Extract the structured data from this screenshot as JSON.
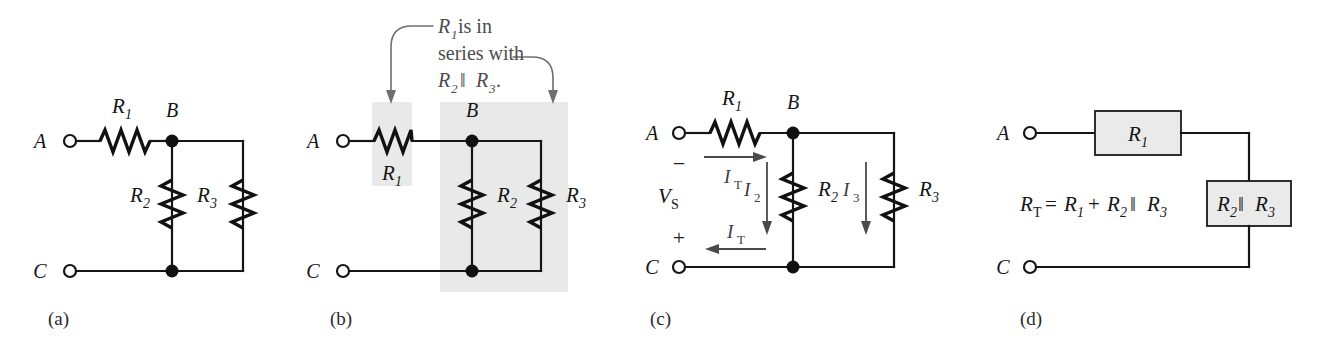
{
  "figure": {
    "background_color": "#ffffff",
    "wire_color": "#151515",
    "shade_color": "#e9e9e9",
    "block_fill": "#eaeaea",
    "leader_color": "#6f6f6f",
    "current_arrow_color": "#4a4a4a"
  },
  "panels": [
    {
      "id": "a",
      "label": "(a)",
      "caption": "",
      "terminals": [
        "A",
        "C"
      ],
      "node_labels": [
        "B"
      ],
      "resistors": [
        {
          "name": "R",
          "sub": "1",
          "orientation": "horizontal"
        },
        {
          "name": "R",
          "sub": "2",
          "orientation": "vertical"
        },
        {
          "name": "R",
          "sub": "3",
          "orientation": "vertical"
        }
      ]
    },
    {
      "id": "b",
      "label": "(b)",
      "annotation": {
        "line1_italic": "R",
        "line1_sub": "1",
        "line1_rest": " is in",
        "line2": "series with",
        "line3_italic_a": "R",
        "line3_sub_a": "2",
        "line3_bar": " ‖ ",
        "line3_italic_b": "R",
        "line3_sub_b": "3",
        "line3_period": ".",
        "full_text": "R1 is in series with R2 ‖ R3."
      },
      "terminals": [
        "A",
        "C"
      ],
      "node_labels": [
        "B"
      ],
      "resistors": [
        {
          "name": "R",
          "sub": "1",
          "orientation": "horizontal"
        },
        {
          "name": "R",
          "sub": "2",
          "orientation": "vertical"
        },
        {
          "name": "R",
          "sub": "3",
          "orientation": "vertical"
        }
      ],
      "highlight_regions": [
        "R1 series block",
        "R2 parallel R3 block"
      ]
    },
    {
      "id": "c",
      "label": "(c)",
      "terminals": [
        "A",
        "C"
      ],
      "node_labels": [
        "B"
      ],
      "source": {
        "name": "V",
        "sub": "S",
        "polarity_top": "−",
        "polarity_bottom": "+"
      },
      "resistors": [
        {
          "name": "R",
          "sub": "1",
          "orientation": "horizontal"
        },
        {
          "name": "R",
          "sub": "2",
          "orientation": "vertical"
        },
        {
          "name": "R",
          "sub": "3",
          "orientation": "vertical"
        }
      ],
      "currents": [
        {
          "name": "I",
          "sub": "T",
          "direction": "right",
          "position": "top branch"
        },
        {
          "name": "I",
          "sub": "T",
          "direction": "left",
          "position": "bottom branch"
        },
        {
          "name": "I",
          "sub": "2",
          "direction": "down",
          "position": "through R2"
        },
        {
          "name": "I",
          "sub": "3",
          "direction": "down",
          "position": "through R3"
        }
      ]
    },
    {
      "id": "d",
      "label": "(d)",
      "terminals": [
        "A",
        "C"
      ],
      "equation": {
        "lhs": "R",
        "lhs_sub": "T",
        "equals": " = ",
        "t1": "R",
        "t1_sub": "1",
        "plus": " + ",
        "t2": "R",
        "t2_sub": "2",
        "bar": " ‖ ",
        "t3": "R",
        "t3_sub": "3",
        "full_text": "RT = R1 + R2 ‖ R3"
      },
      "blocks": [
        {
          "name": "R",
          "sub": "1",
          "bar": "",
          "name2": "",
          "sub2": ""
        },
        {
          "name": "R",
          "sub": "2",
          "bar": " ‖ ",
          "name2": "R",
          "sub2": "3"
        }
      ]
    }
  ],
  "text": {
    "A": "A",
    "B": "B",
    "C": "C",
    "R": "R",
    "s1": "1",
    "s2": "2",
    "s3": "3",
    "sT": "T",
    "sS": "S",
    "I": "I",
    "V": "V",
    "par": "‖",
    "plus": "+",
    "minus": "−",
    "eq": "=",
    "period": ".",
    "anno_is_in": " is in",
    "anno_series_with": "series with",
    "panel_a": "(a)",
    "panel_b": "(b)",
    "panel_c": "(c)",
    "panel_d": "(d)"
  }
}
